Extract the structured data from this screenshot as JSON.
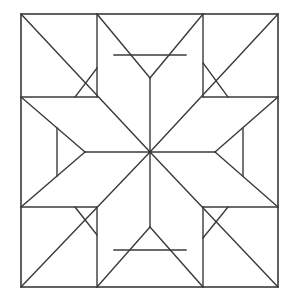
{
  "figure": {
    "kind": "line-drawing",
    "alt": "Square quilt block outline containing an eight pointed star with four corner squares and four side rectangles",
    "background_color": "#ffffff",
    "line_color": "#3a3a3a",
    "fill_color": "#ffffff",
    "line_width": 1.4,
    "canvas": {
      "width": 286,
      "height": 301
    }
  },
  "geometry": {
    "block": {
      "left": 21,
      "top": 14,
      "right": 278,
      "bottom": 287
    },
    "grid": {
      "vertical": [
        97,
        203
      ],
      "horizontal": [
        97,
        207
      ]
    },
    "center": {
      "x": 150,
      "y": 152
    },
    "star_tips": [
      {
        "name": "tip-n",
        "x": 150,
        "y": 14
      },
      {
        "name": "tip-ne",
        "x": 278,
        "y": 14
      },
      {
        "name": "tip-e",
        "x": 278,
        "y": 152
      },
      {
        "name": "tip-se",
        "x": 278,
        "y": 287
      },
      {
        "name": "tip-s",
        "x": 150,
        "y": 287
      },
      {
        "name": "tip-sw",
        "x": 21,
        "y": 287
      },
      {
        "name": "tip-w",
        "x": 21,
        "y": 152
      },
      {
        "name": "tip-nw",
        "x": 21,
        "y": 14
      }
    ],
    "inner_apexes": [
      {
        "name": "apex-top",
        "x": 150,
        "y": 78
      },
      {
        "name": "apex-bottom",
        "x": 150,
        "y": 227
      },
      {
        "name": "apex-left",
        "x": 85,
        "y": 152
      },
      {
        "name": "apex-right",
        "x": 215,
        "y": 152
      }
    ],
    "inner_bars": [
      {
        "name": "bar-top",
        "x1": 114,
        "y1": 55,
        "x2": 186,
        "y2": 55
      },
      {
        "name": "bar-bottom",
        "x1": 114,
        "y1": 250,
        "x2": 186,
        "y2": 250
      },
      {
        "name": "bar-left",
        "x1": 57,
        "y1": 128,
        "x2": 57,
        "y2": 176
      },
      {
        "name": "bar-right",
        "x1": 243,
        "y1": 128,
        "x2": 243,
        "y2": 176
      }
    ],
    "corner_diagonals": [
      {
        "name": "corner-nw",
        "x1": 97,
        "y1": 68,
        "x2": 75,
        "y2": 97
      },
      {
        "name": "corner-ne",
        "x1": 203,
        "y1": 63,
        "x2": 228,
        "y2": 97
      },
      {
        "name": "corner-sw",
        "x1": 75,
        "y1": 207,
        "x2": 97,
        "y2": 235
      },
      {
        "name": "corner-se",
        "x1": 228,
        "y1": 207,
        "x2": 203,
        "y2": 238
      }
    ],
    "spokes": [
      {
        "name": "spoke-n",
        "x1": 150,
        "y1": 152,
        "x2": 150,
        "y2": 78
      },
      {
        "name": "spoke-ne",
        "x1": 150,
        "y1": 152,
        "x2": 278,
        "y2": 14
      },
      {
        "name": "spoke-e",
        "x1": 150,
        "y1": 152,
        "x2": 215,
        "y2": 152
      },
      {
        "name": "spoke-se",
        "x1": 150,
        "y1": 152,
        "x2": 278,
        "y2": 287
      },
      {
        "name": "spoke-s",
        "x1": 150,
        "y1": 152,
        "x2": 150,
        "y2": 227
      },
      {
        "name": "spoke-sw",
        "x1": 150,
        "y1": 152,
        "x2": 21,
        "y2": 287
      },
      {
        "name": "spoke-w",
        "x1": 150,
        "y1": 152,
        "x2": 85,
        "y2": 152
      },
      {
        "name": "spoke-nw",
        "x1": 150,
        "y1": 152,
        "x2": 21,
        "y2": 14
      }
    ],
    "star_edges": [
      {
        "name": "edge-n-left",
        "x1": 150,
        "y1": 14,
        "x2": 150,
        "y2": 78
      },
      {
        "name": "edge-n-tip-a",
        "x1": 97,
        "y1": 14,
        "x2": 150,
        "y2": 78
      },
      {
        "name": "edge-n-tip-b",
        "x1": 203,
        "y1": 14,
        "x2": 150,
        "y2": 78
      },
      {
        "name": "edge-s-tip-a",
        "x1": 97,
        "y1": 287,
        "x2": 150,
        "y2": 227
      },
      {
        "name": "edge-s-tip-b",
        "x1": 203,
        "y1": 287,
        "x2": 150,
        "y2": 227
      },
      {
        "name": "edge-w-tip-a",
        "x1": 21,
        "y1": 97,
        "x2": 85,
        "y2": 152
      },
      {
        "name": "edge-w-tip-b",
        "x1": 21,
        "y1": 207,
        "x2": 85,
        "y2": 152
      },
      {
        "name": "edge-e-tip-a",
        "x1": 278,
        "y1": 97,
        "x2": 215,
        "y2": 152
      },
      {
        "name": "edge-e-tip-b",
        "x1": 278,
        "y1": 207,
        "x2": 215,
        "y2": 152
      }
    ]
  }
}
